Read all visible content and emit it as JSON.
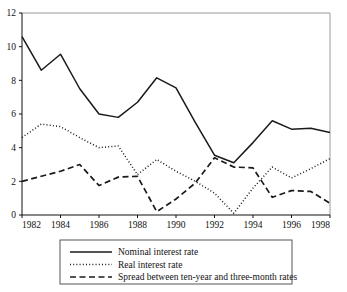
{
  "chart_data": {
    "type": "line",
    "title": "",
    "xlabel": "",
    "ylabel": "",
    "xlim": [
      1982,
      1998
    ],
    "ylim": [
      0,
      12
    ],
    "grid": false,
    "legend_position": "bottom",
    "x": [
      1982,
      1983,
      1984,
      1985,
      1986,
      1987,
      1988,
      1989,
      1990,
      1991,
      1992,
      1993,
      1994,
      1995,
      1996,
      1997,
      1998
    ],
    "xticks": [
      1982,
      1984,
      1986,
      1988,
      1990,
      1992,
      1994,
      1996,
      1998
    ],
    "xtick_labels": [
      "1982",
      "1984",
      "1986",
      "1988",
      "1990",
      "1992",
      "1994",
      "1996",
      "1998"
    ],
    "yticks": [
      0,
      2,
      4,
      6,
      8,
      10,
      12
    ],
    "ytick_labels": [
      "0",
      "2",
      "4",
      "6",
      "8",
      "10",
      "12"
    ],
    "series": [
      {
        "name": "Nominal interest rate",
        "style": "solid",
        "color": "#1a1a1a",
        "values": [
          10.6,
          8.6,
          9.55,
          7.5,
          6.0,
          5.8,
          6.7,
          8.15,
          7.55,
          5.5,
          3.55,
          3.1,
          4.3,
          5.6,
          5.1,
          5.15,
          4.9
        ]
      },
      {
        "name": "Real interest rate",
        "style": "dotted",
        "color": "#1a1a1a",
        "values": [
          4.6,
          5.4,
          5.25,
          4.6,
          4.0,
          4.1,
          2.4,
          3.3,
          2.6,
          2.0,
          1.3,
          0.1,
          1.6,
          2.85,
          2.2,
          2.75,
          3.35
        ]
      },
      {
        "name": "Spread between ten-year and three-month rates",
        "style": "dashed",
        "color": "#1a1a1a",
        "values": [
          2.0,
          2.3,
          2.6,
          3.0,
          1.75,
          2.25,
          2.3,
          0.2,
          0.95,
          1.9,
          3.4,
          2.85,
          2.8,
          1.05,
          1.45,
          1.4,
          0.7
        ]
      }
    ],
    "legend_entries": [
      {
        "label": "Nominal interest rate",
        "style": "solid"
      },
      {
        "label": "Real interest rate",
        "style": "dotted"
      },
      {
        "label": "Spread between ten-year and three-month rates",
        "style": "dashed"
      }
    ]
  }
}
